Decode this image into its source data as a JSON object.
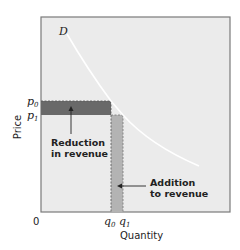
{
  "diagram": {
    "type": "economics-revenue-diagram",
    "colors": {
      "background": "#ffffff",
      "plot_fill": "#ebebeb",
      "frame": "#7a7a7a",
      "reduction_fill": "#696969",
      "addition_fill": "#b3b3b3",
      "curve": "#ffffff",
      "text": "#222222"
    },
    "curve_label": "D",
    "y_axis": {
      "title": "Price",
      "ticks": [
        {
          "label": "p",
          "sub": "0"
        },
        {
          "label": "p",
          "sub": "1"
        }
      ]
    },
    "x_axis": {
      "title": "Quantity",
      "origin": "0",
      "ticks": [
        {
          "label": "q",
          "sub": "0"
        },
        {
          "label": "q",
          "sub": "1"
        }
      ]
    },
    "annotations": {
      "reduction": {
        "line1": "Reduction",
        "line2": "in revenue"
      },
      "addition": {
        "line1": "Addition",
        "line2": "to revenue"
      }
    }
  }
}
